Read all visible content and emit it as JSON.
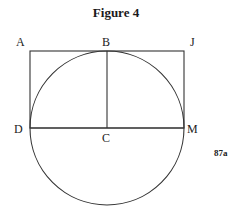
{
  "figure": {
    "title": "Figure 4",
    "code": "87a",
    "points": {
      "A": "A",
      "B": "B",
      "J": "J",
      "D": "D",
      "C": "C",
      "M": "M"
    },
    "geometry": {
      "circle": {
        "cx": 107,
        "cy": 128,
        "r": 77
      },
      "rectangle": {
        "x1": 30,
        "y1": 51,
        "x2": 184,
        "y2": 128
      },
      "segments": [
        {
          "from": "B",
          "to": "C"
        },
        {
          "from": "D",
          "to": "M"
        }
      ],
      "stroke_color": "#333333"
    }
  }
}
